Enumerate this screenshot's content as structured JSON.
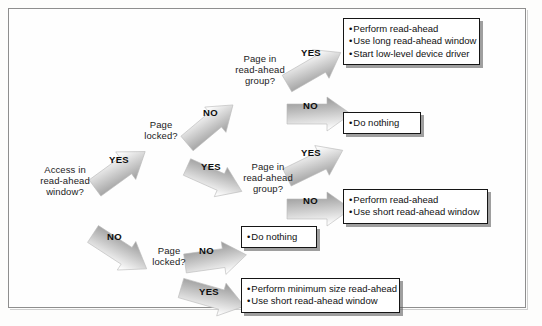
{
  "diagram": {
    "type": "flowchart",
    "decisions": [
      {
        "id": "access-window",
        "label": "Access in\nread-ahead\nwindow?"
      },
      {
        "id": "page-locked-upper",
        "label": "Page\nlocked?"
      },
      {
        "id": "page-in-group-upper",
        "label": "Page in\nread-ahead\ngroup?"
      },
      {
        "id": "page-in-group-lower",
        "label": "Page in\nread-ahead\ngroup?"
      },
      {
        "id": "page-locked-lower",
        "label": "Page\nlocked?"
      }
    ],
    "arrows": [
      {
        "id": "a1",
        "label": "YES",
        "from": "access-window",
        "to": "page-locked-upper"
      },
      {
        "id": "a2",
        "label": "NO",
        "from": "access-window",
        "to": "page-locked-lower"
      },
      {
        "id": "a3",
        "label": "NO",
        "from": "page-locked-upper",
        "to": "page-in-group-upper"
      },
      {
        "id": "a4",
        "label": "YES",
        "from": "page-locked-upper",
        "to": "page-in-group-lower"
      },
      {
        "id": "a5",
        "label": "YES",
        "from": "page-in-group-upper",
        "to": "outcome-long"
      },
      {
        "id": "a6",
        "label": "NO",
        "from": "page-in-group-upper",
        "to": "outcome-donothing-1"
      },
      {
        "id": "a7",
        "label": "YES",
        "from": "page-in-group-lower",
        "to": "outcome-donothing-1"
      },
      {
        "id": "a8",
        "label": "NO",
        "from": "page-in-group-lower",
        "to": "outcome-short"
      },
      {
        "id": "a9",
        "label": "NO",
        "from": "page-locked-lower",
        "to": "outcome-donothing-2"
      },
      {
        "id": "a10",
        "label": "YES",
        "from": "page-locked-lower",
        "to": "outcome-minimum"
      }
    ],
    "outcomes": [
      {
        "id": "outcome-long",
        "items": [
          "Perform read-ahead",
          "Use long read-ahead window",
          "Start low-level device driver"
        ]
      },
      {
        "id": "outcome-donothing-1",
        "items": [
          "Do nothing"
        ]
      },
      {
        "id": "outcome-short",
        "items": [
          "Perform read-ahead",
          "Use short read-ahead window"
        ]
      },
      {
        "id": "outcome-donothing-2",
        "items": [
          "Do nothing"
        ]
      },
      {
        "id": "outcome-minimum",
        "items": [
          "Perform minimum size read-ahead",
          "Use short read-ahead window"
        ]
      }
    ],
    "colors": {
      "box_border": "#151515",
      "box_fill": "#ffffff",
      "arrow_light": "#f2f2f2",
      "arrow_dark": "#8e8e8e",
      "frame_border": "#8e8e8e",
      "text": "#101010"
    }
  }
}
